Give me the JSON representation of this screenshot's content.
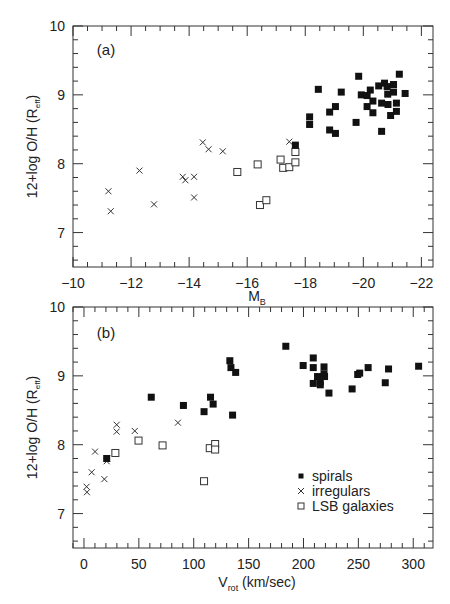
{
  "chart_data": [
    {
      "type": "scatter",
      "panel_label": "(a)",
      "xlabel": "M",
      "xlabel_sub": "B",
      "ylabel": "12+log O/H (R",
      "ylabel_sub": "eff",
      "ylabel_close": ")",
      "xlim": [
        -10,
        -22.4
      ],
      "ylim": [
        6.5,
        10
      ],
      "x_ticks": [
        -10,
        -12,
        -14,
        -16,
        -18,
        -20,
        -22
      ],
      "x_tick_labels": [
        "−10",
        "−12",
        "−14",
        "−16",
        "−18",
        "−20",
        "−22"
      ],
      "x_minor_step": 0.5,
      "y_ticks": [
        7,
        8,
        9,
        10
      ],
      "y_tick_labels": [
        "7",
        "8",
        "9",
        "10"
      ],
      "y_minor_step": 0.2,
      "grid": false,
      "series": [
        {
          "name": "spirals",
          "marker": "filled-square",
          "points": [
            [
              -18.15,
              8.68
            ],
            [
              -18.15,
              8.57
            ],
            [
              -18.45,
              9.08
            ],
            [
              -18.84,
              8.75
            ],
            [
              -18.84,
              8.49
            ],
            [
              -19.04,
              8.83
            ],
            [
              -19.04,
              8.44
            ],
            [
              -19.24,
              9.04
            ],
            [
              -19.75,
              8.6
            ],
            [
              -19.84,
              9.27
            ],
            [
              -19.93,
              9.0
            ],
            [
              -20.13,
              8.99
            ],
            [
              -20.13,
              8.83
            ],
            [
              -20.24,
              9.07
            ],
            [
              -20.33,
              8.91
            ],
            [
              -20.33,
              8.74
            ],
            [
              -20.53,
              9.13
            ],
            [
              -20.63,
              8.88
            ],
            [
              -20.63,
              8.47
            ],
            [
              -20.73,
              9.17
            ],
            [
              -20.82,
              9.12
            ],
            [
              -20.84,
              9.01
            ],
            [
              -20.85,
              8.86
            ],
            [
              -20.94,
              8.7
            ],
            [
              -21.04,
              9.15
            ],
            [
              -21.04,
              9.04
            ],
            [
              -21.14,
              8.88
            ],
            [
              -21.14,
              8.76
            ],
            [
              -21.24,
              9.3
            ],
            [
              -21.44,
              9.02
            ],
            [
              -17.66,
              8.27
            ]
          ]
        },
        {
          "name": "irregulars",
          "marker": "cross",
          "points": [
            [
              -11.22,
              7.6
            ],
            [
              -11.3,
              7.31
            ],
            [
              -12.29,
              7.9
            ],
            [
              -12.79,
              7.41
            ],
            [
              -13.78,
              7.81
            ],
            [
              -13.87,
              7.76
            ],
            [
              -14.17,
              7.81
            ],
            [
              -14.17,
              7.51
            ],
            [
              -14.47,
              8.31
            ],
            [
              -14.67,
              8.21
            ],
            [
              -15.16,
              8.18
            ],
            [
              -17.45,
              8.32
            ]
          ]
        },
        {
          "name": "LSB galaxies",
          "marker": "open-square",
          "points": [
            [
              -15.66,
              7.88
            ],
            [
              -16.36,
              7.99
            ],
            [
              -16.44,
              7.4
            ],
            [
              -16.66,
              7.47
            ],
            [
              -17.15,
              8.06
            ],
            [
              -17.24,
              7.94
            ],
            [
              -17.45,
              7.95
            ],
            [
              -17.66,
              8.02
            ],
            [
              -17.66,
              8.17
            ]
          ]
        }
      ]
    },
    {
      "type": "scatter",
      "panel_label": "(b)",
      "xlabel": "V",
      "xlabel_sub": "rot",
      "xlabel_rest": " (km/sec)",
      "ylabel": "12+log O/H (R",
      "ylabel_sub": "eff",
      "ylabel_close": ")",
      "xlim": [
        -10,
        318
      ],
      "ylim": [
        6.5,
        10
      ],
      "x_ticks": [
        0,
        50,
        100,
        150,
        200,
        250,
        300
      ],
      "x_tick_labels": [
        "0",
        "50",
        "100",
        "150",
        "200",
        "250",
        "300"
      ],
      "x_minor_step": 10,
      "y_ticks": [
        7,
        8,
        9,
        10
      ],
      "y_tick_labels": [
        "7",
        "8",
        "9",
        "10"
      ],
      "y_minor_step": 0.2,
      "grid": false,
      "legend": {
        "placement": "bottom-right",
        "entries": [
          {
            "label": "spirals",
            "marker": "filled-square"
          },
          {
            "label": "irregulars",
            "marker": "cross"
          },
          {
            "label": "LSB galaxies",
            "marker": "open-square"
          }
        ]
      },
      "series": [
        {
          "name": "spirals",
          "marker": "filled-square",
          "points": [
            [
              61.3,
              8.69
            ],
            [
              90.6,
              8.57
            ],
            [
              109.4,
              8.48
            ],
            [
              115.3,
              8.69
            ],
            [
              117.7,
              8.59
            ],
            [
              20.7,
              7.8
            ],
            [
              132.9,
              9.22
            ],
            [
              133.9,
              9.12
            ],
            [
              138.2,
              9.05
            ],
            [
              135.4,
              8.43
            ],
            [
              183.9,
              9.43
            ],
            [
              199.7,
              9.15
            ],
            [
              208.9,
              9.26
            ],
            [
              208.9,
              9.12
            ],
            [
              208.9,
              8.89
            ],
            [
              212.8,
              8.99
            ],
            [
              215.3,
              8.91
            ],
            [
              215.3,
              8.87
            ],
            [
              218.7,
              9.13
            ],
            [
              218.7,
              9.03
            ],
            [
              219.2,
              8.99
            ],
            [
              223.2,
              8.75
            ],
            [
              244.3,
              8.81
            ],
            [
              249.4,
              9.02
            ],
            [
              251.2,
              9.04
            ],
            [
              258.9,
              9.12
            ],
            [
              274.5,
              8.9
            ],
            [
              277.5,
              9.1
            ],
            [
              304.9,
              9.14
            ]
          ]
        },
        {
          "name": "irregulars",
          "marker": "cross",
          "points": [
            [
              2.4,
              7.39
            ],
            [
              2.7,
              7.31
            ],
            [
              7.0,
              7.6
            ],
            [
              10.1,
              7.9
            ],
            [
              18.6,
              7.5
            ],
            [
              20.7,
              7.76
            ],
            [
              21.0,
              7.8
            ],
            [
              29.8,
              8.29
            ],
            [
              29.8,
              8.19
            ],
            [
              46.3,
              8.2
            ],
            [
              85.6,
              8.32
            ]
          ]
        },
        {
          "name": "LSB galaxies",
          "marker": "open-square",
          "points": [
            [
              28.6,
              7.88
            ],
            [
              49.7,
              8.06
            ],
            [
              71.6,
              7.99
            ],
            [
              109.4,
              7.47
            ],
            [
              114.6,
              7.95
            ],
            [
              119.5,
              8.01
            ],
            [
              119.5,
              7.93
            ]
          ]
        }
      ]
    }
  ]
}
